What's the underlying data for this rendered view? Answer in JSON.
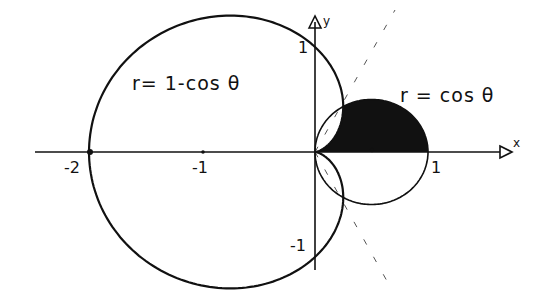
{
  "diagram": {
    "type": "polar-curves",
    "curves": [
      {
        "name": "cardioid",
        "equation": "r = 1 - cos θ",
        "label": "r= 1-cos θ"
      },
      {
        "name": "circle",
        "equation": "r = cos θ",
        "label": "r = cos θ"
      }
    ],
    "shaded_region": "intersection of r = cos θ and r = 1 - cos θ in upper half (between θ = 0 region and θ = π/3)",
    "axes": {
      "x_label": "x",
      "y_label": "y",
      "x_ticks": [
        "-2",
        "-1",
        "1"
      ],
      "y_ticks": [
        "1",
        "-1"
      ]
    },
    "dashed_lines": [
      "θ = π/3",
      "θ = -π/3"
    ],
    "colors": {
      "ink": "#111111",
      "background": "#ffffff"
    }
  }
}
